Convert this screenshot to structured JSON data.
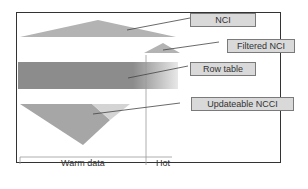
{
  "labels": {
    "nci": "NCI",
    "filtered_nci": "Filtered NCI",
    "row_table": "Row table",
    "updateable_ncci": "Updateable NCCI"
  },
  "axis": {
    "warm": "Warm data",
    "hot": "Hot"
  },
  "colors": {
    "border": "#333333",
    "shape_gray": "#a6a6a6",
    "row_table_dark": "#8c8c8c",
    "row_table_light": "#e6e6e6",
    "label_fill": "#d9d9d9"
  }
}
